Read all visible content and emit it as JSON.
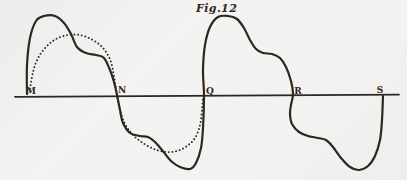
{
  "figure": {
    "caption": "Fig.12",
    "ink_color": "#2b2823",
    "paper_color": "#f1f0ee",
    "axis": {
      "y": 96,
      "x_start": 15,
      "x_end": 399,
      "labels": [
        {
          "text": "M",
          "x": 31,
          "y": 94
        },
        {
          "text": "N",
          "x": 122,
          "y": 93
        },
        {
          "text": "Q",
          "x": 210,
          "y": 94
        },
        {
          "text": "R",
          "x": 298,
          "y": 93.5
        },
        {
          "text": "S",
          "x": 380,
          "y": 92.5
        }
      ]
    },
    "curves": {
      "solid": {
        "name": "distorted-wave",
        "stroke_width": 2.2,
        "points": [
          [
            27,
            94
          ],
          [
            27,
            65
          ],
          [
            30,
            38
          ],
          [
            36,
            21
          ],
          [
            44,
            16
          ],
          [
            55,
            16
          ],
          [
            64,
            23
          ],
          [
            71,
            34
          ],
          [
            77,
            47
          ],
          [
            86,
            53
          ],
          [
            96,
            55
          ],
          [
            104,
            58
          ],
          [
            110,
            70
          ],
          [
            114,
            82
          ],
          [
            117,
            95
          ],
          [
            120,
            110
          ],
          [
            123,
            123
          ],
          [
            130,
            133
          ],
          [
            140,
            136
          ],
          [
            148,
            137
          ],
          [
            155,
            142
          ],
          [
            162,
            150
          ],
          [
            171,
            161
          ],
          [
            180,
            167
          ],
          [
            190,
            169
          ],
          [
            196,
            163
          ],
          [
            201,
            148
          ],
          [
            203,
            128
          ],
          [
            204,
            95
          ],
          [
            203,
            70
          ],
          [
            205,
            45
          ],
          [
            210,
            27
          ],
          [
            218,
            17
          ],
          [
            228,
            16
          ],
          [
            237,
            19
          ],
          [
            244,
            28
          ],
          [
            250,
            40
          ],
          [
            256,
            49
          ],
          [
            263,
            53
          ],
          [
            272,
            54
          ],
          [
            280,
            58
          ],
          [
            286,
            67
          ],
          [
            291,
            81
          ],
          [
            293,
            94
          ],
          [
            291,
            105
          ],
          [
            290,
            114
          ],
          [
            292,
            124
          ],
          [
            299,
            132
          ],
          [
            308,
            136
          ],
          [
            318,
            138
          ],
          [
            326,
            140
          ],
          [
            333,
            147
          ],
          [
            341,
            158
          ],
          [
            350,
            167
          ],
          [
            359,
            170
          ],
          [
            368,
            166
          ],
          [
            375,
            156
          ],
          [
            380,
            140
          ],
          [
            382,
            120
          ],
          [
            383,
            96
          ]
        ]
      },
      "dotted": {
        "name": "sine-reference-wave",
        "stroke_width": 1.9,
        "points": [
          [
            30,
            89
          ],
          [
            33,
            72
          ],
          [
            38,
            58
          ],
          [
            46,
            47
          ],
          [
            56,
            39
          ],
          [
            68,
            35
          ],
          [
            80,
            35
          ],
          [
            91,
            39
          ],
          [
            100,
            45
          ],
          [
            106,
            52
          ],
          [
            111,
            62
          ],
          [
            114,
            76
          ],
          [
            117,
            95
          ],
          [
            120,
            110
          ],
          [
            125,
            124
          ],
          [
            133,
            135
          ],
          [
            143,
            143
          ],
          [
            154,
            149
          ],
          [
            166,
            152
          ],
          [
            177,
            151
          ],
          [
            187,
            146
          ],
          [
            195,
            138
          ],
          [
            200,
            125
          ],
          [
            202,
            110
          ],
          [
            203,
            97
          ]
        ]
      }
    }
  }
}
